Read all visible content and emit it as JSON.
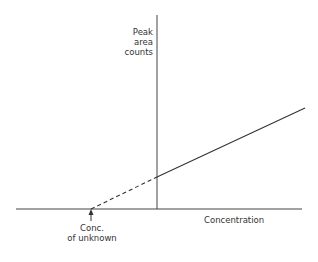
{
  "diagram": {
    "y_axis_label": [
      "Peak",
      "area",
      "counts"
    ],
    "x_axis_label": "Concentration",
    "annotation": [
      "Conc.",
      "of unknown"
    ],
    "line_color": "#333333",
    "elements": {
      "x_axis": {
        "x1": 16,
        "y1": 209,
        "x2": 302,
        "y2": 209
      },
      "y_axis": {
        "x1": 157,
        "y1": 15,
        "x2": 157,
        "y2": 209
      },
      "solid_line": {
        "x1": 157,
        "y1": 177,
        "x2": 305,
        "y2": 108
      },
      "dashed_extrapolation": {
        "x1": 91,
        "y1": 209,
        "x2": 157,
        "y2": 177
      },
      "arrow": {
        "x": 91,
        "y_from": 221,
        "y_to": 209
      }
    }
  }
}
